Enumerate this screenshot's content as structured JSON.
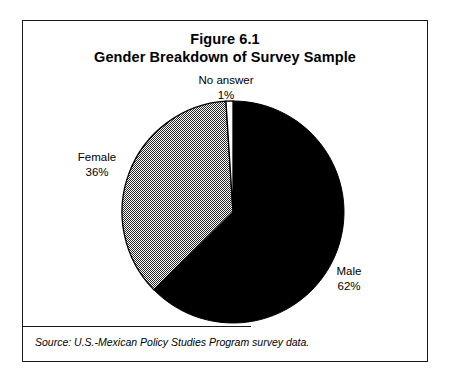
{
  "figure": {
    "title_line1": "Figure 6.1",
    "title_line2": "Gender Breakdown of Survey Sample",
    "source": "Source:  U.S.-Mexican Policy Studies Program survey data."
  },
  "labels": {
    "no_answer_name": "No answer",
    "no_answer_value": "1%",
    "female_name": "Female",
    "female_value": "36%",
    "male_name": "Male",
    "male_value": "62%"
  },
  "chart_data": {
    "type": "pie",
    "categories": [
      "No answer",
      "Male",
      "Female"
    ],
    "values": [
      1,
      62,
      36
    ],
    "unit": "percent",
    "start_angle_deg": 0,
    "direction": "clockwise",
    "slice_styles": [
      "white",
      "black",
      "gray-halftone"
    ],
    "colors": [
      "#ffffff",
      "#000000",
      "#808080"
    ],
    "legend": "none",
    "data_labels": [
      "No answer 1%",
      "Male 62%",
      "Female 36%"
    ],
    "grid": false,
    "xlabel": "",
    "ylabel": "",
    "source": "Source:  U.S.-Mexican Policy Studies Program survey data."
  }
}
